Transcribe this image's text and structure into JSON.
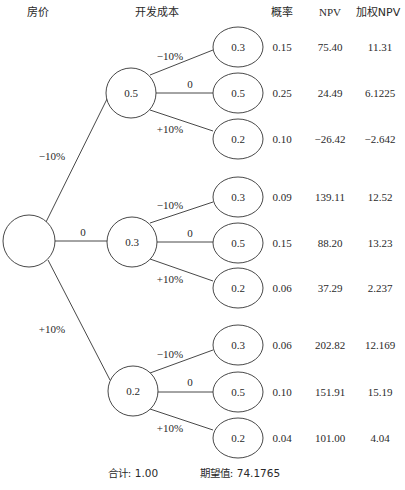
{
  "headers": {
    "house_price": "房价",
    "dev_cost": "开发成本",
    "probability": "概率",
    "npv": "NPV",
    "weighted_npv": "加权NPV"
  },
  "root": {
    "label": ""
  },
  "branches": [
    {
      "edge_label": "−10%",
      "node_value": "0.5",
      "children": [
        {
          "edge_label": "−10%",
          "node_value": "0.3",
          "probability": "0.15",
          "npv": "75.40",
          "weighted_npv": "11.31"
        },
        {
          "edge_label": "0",
          "node_value": "0.5",
          "probability": "0.25",
          "npv": "24.49",
          "weighted_npv": "6.1225"
        },
        {
          "edge_label": "+10%",
          "node_value": "0.2",
          "probability": "0.10",
          "npv": "−26.42",
          "weighted_npv": "−2.642"
        }
      ]
    },
    {
      "edge_label": "0",
      "node_value": "0.3",
      "children": [
        {
          "edge_label": "−10%",
          "node_value": "0.3",
          "probability": "0.09",
          "npv": "139.11",
          "weighted_npv": "12.52"
        },
        {
          "edge_label": "0",
          "node_value": "0.5",
          "probability": "0.15",
          "npv": "88.20",
          "weighted_npv": "13.23"
        },
        {
          "edge_label": "+10%",
          "node_value": "0.2",
          "probability": "0.06",
          "npv": "37.29",
          "weighted_npv": "2.237"
        }
      ]
    },
    {
      "edge_label": "+10%",
      "node_value": "0.2",
      "children": [
        {
          "edge_label": "−10%",
          "node_value": "0.3",
          "probability": "0.06",
          "npv": "202.82",
          "weighted_npv": "12.169"
        },
        {
          "edge_label": "0",
          "node_value": "0.5",
          "probability": "0.10",
          "npv": "151.91",
          "weighted_npv": "15.19"
        },
        {
          "edge_label": "+10%",
          "node_value": "0.2",
          "probability": "0.04",
          "npv": "101.00",
          "weighted_npv": "4.04"
        }
      ]
    }
  ],
  "footer": {
    "total": "合计: 1.00",
    "expected_value": "期望值: 74.1765"
  }
}
